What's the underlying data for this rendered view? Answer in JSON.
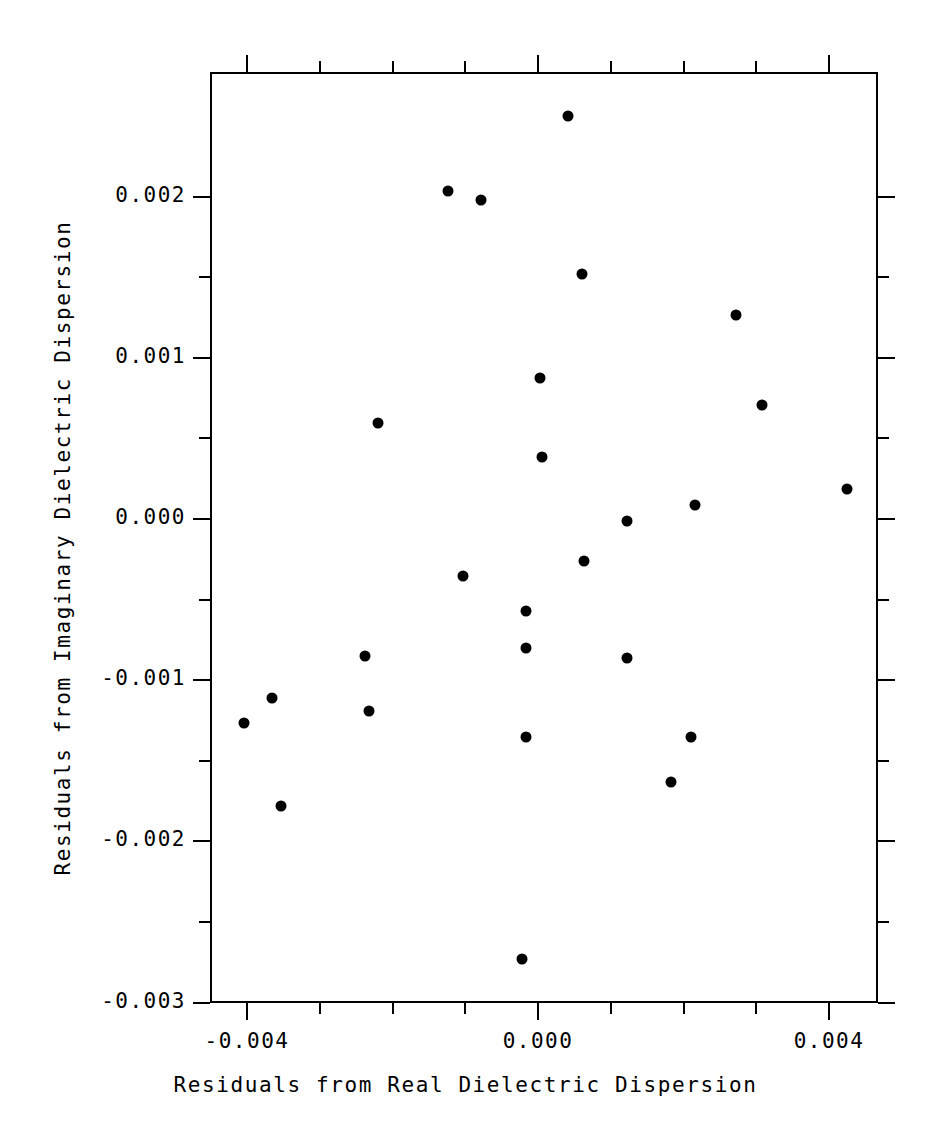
{
  "chart_data": {
    "type": "scatter",
    "title": "",
    "xlabel": "Residuals from Real Dielectric Dispersion",
    "ylabel": "Residuals from Imaginary Dielectric Dispersion",
    "xlim": [
      -0.00451,
      0.00467
    ],
    "ylim": [
      -0.003,
      0.00268
    ],
    "grid": false,
    "legend": null,
    "marker": "filled-circle",
    "marker_color": "#000000",
    "xticks": [
      -0.004,
      -0.003,
      -0.002,
      -0.001,
      0.0,
      0.001,
      0.002,
      0.003,
      0.004
    ],
    "xtick_labels": [
      "-0.004",
      "",
      "",
      "",
      "0.000",
      "",
      "",
      "",
      "0.004"
    ],
    "yticks": [
      0.002,
      0.0015,
      0.001,
      0.0005,
      0.0,
      -0.0005,
      -0.001,
      -0.0015,
      -0.002,
      -0.0025,
      -0.003
    ],
    "ytick_labels": [
      "0.002",
      "",
      "0.001",
      "",
      "0.000",
      "",
      "-0.001",
      "",
      "-0.002",
      "",
      "-0.003"
    ],
    "n_points": 24,
    "points": [
      {
        "x": 0.00038,
        "y": 0.00251
      },
      {
        "x": -0.00126,
        "y": 0.00205
      },
      {
        "x": -0.00081,
        "y": 0.00199
      },
      {
        "x": 0.00058,
        "y": 0.00153
      },
      {
        "x": 0.00269,
        "y": 0.00128
      },
      {
        "x": 0.0,
        "y": 0.00089
      },
      {
        "x": 0.00305,
        "y": 0.00072
      },
      {
        "x": -0.00223,
        "y": 0.00061
      },
      {
        "x": 3e-05,
        "y": 0.0004
      },
      {
        "x": 0.00422,
        "y": 0.0002
      },
      {
        "x": 0.00213,
        "y": 0.0001
      },
      {
        "x": 0.0012,
        "y": 0.0
      },
      {
        "x": 0.0006,
        "y": -0.00025
      },
      {
        "x": -0.00106,
        "y": -0.00034
      },
      {
        "x": -0.00019,
        "y": -0.00056
      },
      {
        "x": -0.0024,
        "y": -0.00084
      },
      {
        "x": -0.00019,
        "y": -0.00079
      },
      {
        "x": 0.0012,
        "y": -0.00085
      },
      {
        "x": -0.00407,
        "y": -0.00125
      },
      {
        "x": -0.00369,
        "y": -0.0011
      },
      {
        "x": -0.00235,
        "y": -0.00118
      },
      {
        "x": -0.00019,
        "y": -0.00134
      },
      {
        "x": 0.00208,
        "y": -0.00134
      },
      {
        "x": 0.0018,
        "y": -0.00162
      },
      {
        "x": -0.00356,
        "y": -0.00177
      },
      {
        "x": -0.00025,
        "y": -0.00272
      }
    ]
  },
  "axes": {
    "x_title": "Residuals from Real Dielectric Dispersion",
    "y_title": "Residuals from Imaginary Dielectric Dispersion",
    "x_labels": [
      "-0.004",
      "0.000",
      "0.004"
    ],
    "y_labels": [
      "0.002",
      "0.001",
      "0.000",
      "-0.001",
      "-0.002",
      "-0.003"
    ]
  }
}
